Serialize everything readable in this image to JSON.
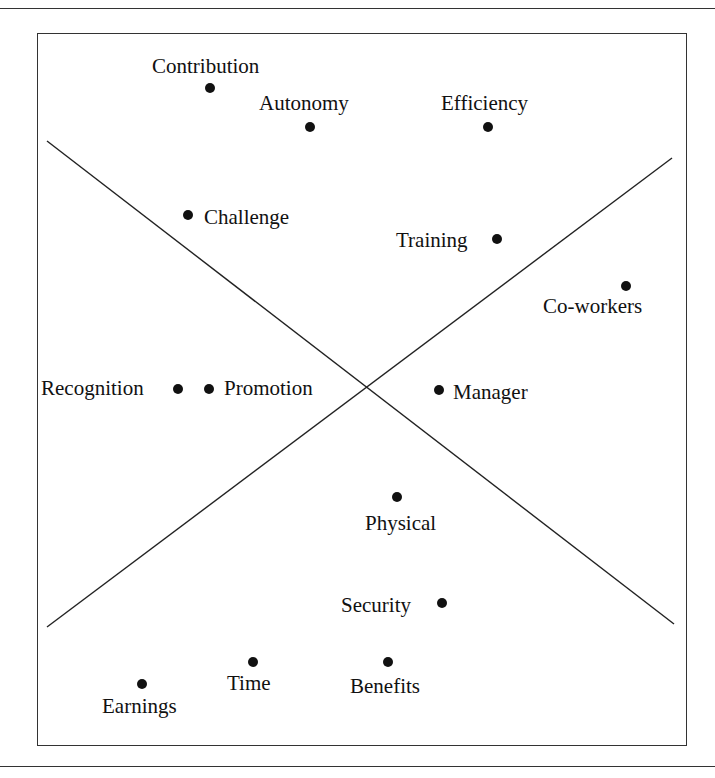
{
  "diagram": {
    "type": "quadrant-scatter",
    "frame": {
      "x": 37,
      "y": 33,
      "width": 650,
      "height": 713
    },
    "rules": [
      {
        "y": 8
      },
      {
        "y": 766
      }
    ],
    "dividers": [
      {
        "name": "descending-diagonal",
        "x1": 47,
        "y1": 141,
        "x2": 674,
        "y2": 624
      },
      {
        "name": "ascending-diagonal",
        "x1": 47,
        "y1": 627,
        "x2": 672,
        "y2": 158
      }
    ],
    "points": [
      {
        "id": "contribution",
        "label": "Contribution",
        "x": 210,
        "y": 88,
        "lx": 152,
        "ly": 56
      },
      {
        "id": "autonomy",
        "label": "Autonomy",
        "x": 310,
        "y": 127,
        "lx": 259,
        "ly": 93
      },
      {
        "id": "efficiency",
        "label": "Efficiency",
        "x": 488,
        "y": 127,
        "lx": 441,
        "ly": 93
      },
      {
        "id": "challenge",
        "label": "Challenge",
        "x": 188,
        "y": 215,
        "lx": 204,
        "ly": 207
      },
      {
        "id": "training",
        "label": "Training",
        "x": 497,
        "y": 239,
        "lx": 396,
        "ly": 230
      },
      {
        "id": "co-workers",
        "label": "Co-workers",
        "x": 626,
        "y": 286,
        "lx": 543,
        "ly": 296
      },
      {
        "id": "recognition",
        "label": "Recognition",
        "x": 178,
        "y": 389,
        "lx": 41,
        "ly": 378
      },
      {
        "id": "promotion",
        "label": "Promotion",
        "x": 209,
        "y": 389,
        "lx": 224,
        "ly": 378
      },
      {
        "id": "manager",
        "label": "Manager",
        "x": 439,
        "y": 390,
        "lx": 453,
        "ly": 382
      },
      {
        "id": "physical",
        "label": "Physical",
        "x": 397,
        "y": 497,
        "lx": 365,
        "ly": 513
      },
      {
        "id": "security",
        "label": "Security",
        "x": 442,
        "y": 603,
        "lx": 341,
        "ly": 595
      },
      {
        "id": "time",
        "label": "Time",
        "x": 253,
        "y": 662,
        "lx": 227,
        "ly": 673
      },
      {
        "id": "benefits",
        "label": "Benefits",
        "x": 388,
        "y": 662,
        "lx": 350,
        "ly": 676
      },
      {
        "id": "earnings",
        "label": "Earnings",
        "x": 142,
        "y": 684,
        "lx": 102,
        "ly": 696
      }
    ]
  }
}
